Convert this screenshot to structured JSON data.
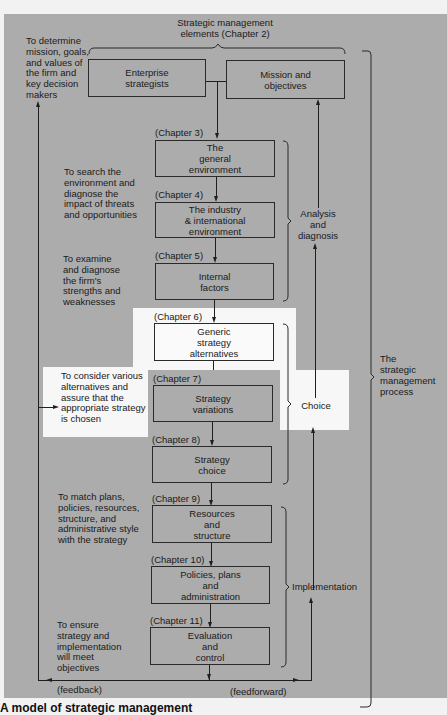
{
  "diagram": {
    "top_label": "Strategic management\nelements (Chapter 2)",
    "top_boxes": [
      {
        "label": "Enterprise\nstrategists"
      },
      {
        "label": "Mission and\nobjectives"
      }
    ],
    "steps": [
      {
        "chapter": "(Chapter 3)",
        "label": "The\ngeneral\nenvironment"
      },
      {
        "chapter": "(Chapter 4)",
        "label": "The industry\n& international\nenvironment"
      },
      {
        "chapter": "(Chapter 5)",
        "label": "Internal\nfactors"
      },
      {
        "chapter": "(Chapter 6)",
        "label": "Generic\nstrategy\nalternatives"
      },
      {
        "chapter": "(Chapter 7)",
        "label": "Strategy\nvariations"
      },
      {
        "chapter": "(Chapter 8)",
        "label": "Strategy\nchoice"
      },
      {
        "chapter": "(Chapter 9)",
        "label": "Resources\nand\nstructure"
      },
      {
        "chapter": "(Chapter 10)",
        "label": "Policies, plans\nand\nadministration"
      },
      {
        "chapter": "(Chapter 11)",
        "label": "Evaluation\nand\ncontrol"
      }
    ],
    "notes": [
      "To determine\nmission, goals,\nand values of\nthe firm and\nkey decision\nmakers",
      "To search the\nenvironment and\ndiagnose the\nimpact of threats\nand opportunities",
      "To examine\nand diagnose\nthe firm's\nstrengths and\nweaknesses",
      "To consider various\nalternatives and\nassure that the\nappropriate strategy\nis chosen",
      "To match plans,\npolicies, resources,\nstructure, and\nadministrative style\nwith the strategy",
      "To ensure\nstrategy and\nimplementation\nwill meet\nobjectives"
    ],
    "phases": [
      {
        "label": "Analysis\nand\ndiagnosis"
      },
      {
        "label": "Choice"
      },
      {
        "label": "Implementation"
      }
    ],
    "process_label": "The\nstrategic\nmanagement\nprocess",
    "feedback_label": "(feedback)",
    "feedforward_label": "(feedforward)",
    "caption": "A model of strategic management"
  }
}
